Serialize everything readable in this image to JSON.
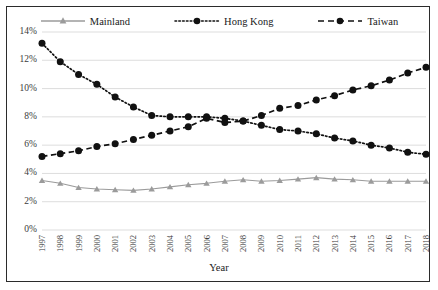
{
  "legend": {
    "position": "top-center",
    "entries": [
      {
        "label": "Mainland",
        "icon": "line-triangle-marker-icon",
        "color": "#9b9b9b",
        "dash": "solid",
        "marker": "triangle"
      },
      {
        "label": "Hong Kong",
        "icon": "line-circle-marker-icon",
        "color": "#111111",
        "dash": "dotted",
        "marker": "circle"
      },
      {
        "label": "Taiwan",
        "icon": "line-circle-marker-icon",
        "color": "#111111",
        "dash": "dashed",
        "marker": "circle"
      }
    ]
  },
  "axes": {
    "x_title": "Year",
    "y_ticks": [
      "0%",
      "2%",
      "4%",
      "6%",
      "8%",
      "10%",
      "12%",
      "14%"
    ],
    "x_ticks": [
      "1997",
      "1998",
      "1999",
      "2000",
      "2001",
      "2002",
      "2003",
      "2004",
      "2005",
      "2006",
      "2007",
      "2008",
      "2009",
      "2010",
      "2011",
      "2012",
      "2013",
      "2014",
      "2015",
      "2016",
      "2017",
      "2018"
    ]
  },
  "chart_data": {
    "type": "line",
    "title": "",
    "xlabel": "Year",
    "ylabel": "",
    "ylim": [
      0,
      14
    ],
    "ytick_step": 2,
    "ytick_format": "percent",
    "grid": "horizontal",
    "legend_position": "top-center",
    "x": [
      "1997",
      "1998",
      "1999",
      "2000",
      "2001",
      "2002",
      "2003",
      "2004",
      "2005",
      "2006",
      "2007",
      "2008",
      "2009",
      "2010",
      "2011",
      "2012",
      "2013",
      "2014",
      "2015",
      "2016",
      "2017",
      "2018"
    ],
    "series": [
      {
        "name": "Mainland",
        "color": "#9b9b9b",
        "dash": "solid",
        "marker": "triangle",
        "values": [
          3.5,
          3.3,
          3.0,
          2.9,
          2.85,
          2.8,
          2.9,
          3.05,
          3.2,
          3.3,
          3.45,
          3.55,
          3.45,
          3.5,
          3.6,
          3.7,
          3.6,
          3.55,
          3.45,
          3.45,
          3.45,
          3.45
        ]
      },
      {
        "name": "Hong Kong",
        "color": "#111111",
        "dash": "dotted",
        "marker": "circle",
        "values": [
          13.2,
          11.9,
          11.0,
          10.3,
          9.4,
          8.7,
          8.1,
          8.0,
          8.0,
          8.0,
          7.9,
          7.7,
          7.4,
          7.1,
          7.0,
          6.8,
          6.5,
          6.3,
          6.0,
          5.8,
          5.5,
          5.35
        ]
      },
      {
        "name": "Taiwan",
        "color": "#111111",
        "dash": "dashed",
        "marker": "circle",
        "values": [
          5.2,
          5.4,
          5.6,
          5.9,
          6.1,
          6.4,
          6.7,
          7.0,
          7.3,
          7.9,
          7.6,
          7.7,
          8.1,
          8.6,
          8.8,
          9.2,
          9.5,
          9.9,
          10.2,
          10.6,
          11.1,
          11.5
        ]
      }
    ]
  },
  "colors": {
    "border": "#2b2b2b",
    "gridline": "#d9d9d9",
    "mainland": "#9b9b9b",
    "hongkong": "#111111",
    "taiwan": "#111111",
    "background": "#ffffff"
  }
}
